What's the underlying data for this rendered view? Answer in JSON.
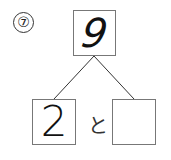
{
  "problem": {
    "number_label": "⑦",
    "total": "9",
    "part_left": "2",
    "connector": "と",
    "part_right": ""
  }
}
